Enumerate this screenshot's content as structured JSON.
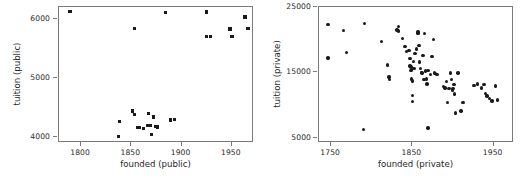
{
  "figure": {
    "layout": "two-panel-side-by-side",
    "background": "#ffffff",
    "marker_color": "#1a1a1a",
    "axis_color": "#7a7a7a"
  },
  "chart_data": [
    {
      "type": "scatter",
      "title": "",
      "xlabel": "founded (public)",
      "ylabel": "tuition (public)",
      "xlim": [
        1778,
        1972
      ],
      "ylim": [
        3900,
        6200
      ],
      "xticks": [
        1800,
        1850,
        1900,
        1950
      ],
      "yticks": [
        4000,
        5000,
        6000
      ],
      "grid": false,
      "legend": false,
      "marker": "square",
      "points": [
        [
          1789,
          6120
        ],
        [
          1853,
          5840
        ],
        [
          1884,
          6110
        ],
        [
          1925,
          6115
        ],
        [
          1925,
          5700
        ],
        [
          1929,
          5700
        ],
        [
          1948,
          5830
        ],
        [
          1950,
          5700
        ],
        [
          1963,
          6030
        ],
        [
          1966,
          5840
        ],
        [
          1837,
          4010
        ],
        [
          1838,
          4260
        ],
        [
          1851,
          4440
        ],
        [
          1853,
          4385
        ],
        [
          1856,
          4160
        ],
        [
          1858,
          4165
        ],
        [
          1862,
          4150
        ],
        [
          1866,
          4200
        ],
        [
          1867,
          4400
        ],
        [
          1868,
          4195
        ],
        [
          1869,
          4200
        ],
        [
          1870,
          4040
        ],
        [
          1872,
          4340
        ],
        [
          1874,
          4175
        ],
        [
          1876,
          4170
        ],
        [
          1889,
          4290
        ],
        [
          1893,
          4295
        ]
      ]
    },
    {
      "type": "scatter",
      "title": "",
      "xlabel": "founded (private)",
      "ylabel": "tuition (private)",
      "xlim": [
        1735,
        1975
      ],
      "ylim": [
        4200,
        25000
      ],
      "xticks": [
        1750,
        1850,
        1950
      ],
      "yticks": [
        5000,
        15000,
        25000
      ],
      "grid": false,
      "legend": false,
      "marker": "circle",
      "points": [
        [
          1746,
          22300
        ],
        [
          1746,
          17200
        ],
        [
          1765,
          21400
        ],
        [
          1769,
          18000
        ],
        [
          1791,
          22500
        ],
        [
          1790,
          6300
        ],
        [
          1812,
          19700
        ],
        [
          1819,
          16100
        ],
        [
          1822,
          13900
        ],
        [
          1821,
          14300
        ],
        [
          1831,
          21500
        ],
        [
          1833,
          22000
        ],
        [
          1833,
          21300
        ],
        [
          1838,
          20200
        ],
        [
          1841,
          19000
        ],
        [
          1843,
          18200
        ],
        [
          1846,
          18300
        ],
        [
          1847,
          17100
        ],
        [
          1847,
          16000
        ],
        [
          1848,
          15800
        ],
        [
          1848,
          15300
        ],
        [
          1849,
          15400
        ],
        [
          1849,
          14000
        ],
        [
          1850,
          13700
        ],
        [
          1850,
          11500
        ],
        [
          1850,
          10500
        ],
        [
          1851,
          16700
        ],
        [
          1852,
          15600
        ],
        [
          1853,
          17900
        ],
        [
          1855,
          18600
        ],
        [
          1857,
          20900
        ],
        [
          1857,
          21200
        ],
        [
          1858,
          19100
        ],
        [
          1859,
          16600
        ],
        [
          1860,
          15600
        ],
        [
          1861,
          15000
        ],
        [
          1862,
          14900
        ],
        [
          1863,
          17600
        ],
        [
          1864,
          13900
        ],
        [
          1865,
          20900
        ],
        [
          1866,
          15200
        ],
        [
          1867,
          14000
        ],
        [
          1868,
          13200
        ],
        [
          1869,
          15300
        ],
        [
          1869,
          6500
        ],
        [
          1872,
          14700
        ],
        [
          1874,
          17400
        ],
        [
          1876,
          20000
        ],
        [
          1877,
          15000
        ],
        [
          1878,
          14800
        ],
        [
          1880,
          14700
        ],
        [
          1888,
          12800
        ],
        [
          1890,
          12600
        ],
        [
          1892,
          13600
        ],
        [
          1893,
          10400
        ],
        [
          1895,
          12500
        ],
        [
          1897,
          14900
        ],
        [
          1898,
          13900
        ],
        [
          1899,
          12300
        ],
        [
          1900,
          12500
        ],
        [
          1901,
          13100
        ],
        [
          1902,
          11700
        ],
        [
          1903,
          8800
        ],
        [
          1906,
          14900
        ],
        [
          1910,
          9100
        ],
        [
          1912,
          10400
        ],
        [
          1926,
          13000
        ],
        [
          1930,
          13200
        ],
        [
          1935,
          12600
        ],
        [
          1938,
          13100
        ],
        [
          1940,
          11800
        ],
        [
          1942,
          11400
        ],
        [
          1945,
          11000
        ],
        [
          1948,
          10600
        ],
        [
          1952,
          12900
        ],
        [
          1955,
          10800
        ]
      ]
    }
  ]
}
